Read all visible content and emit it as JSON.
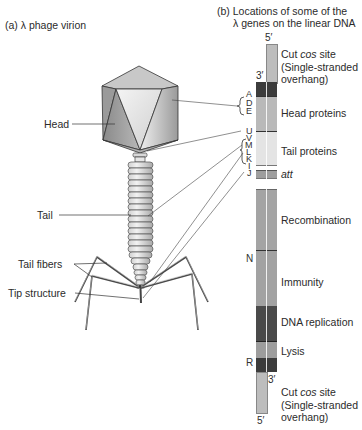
{
  "panel_a": {
    "title": "(a)  λ phage virion",
    "labels": {
      "head": "Head",
      "tail": "Tail",
      "tail_fibers": "Tail fibers",
      "tip_structure": "Tip structure"
    }
  },
  "panel_b": {
    "title_line1": "(b) Locations of some of the",
    "title_line2": "λ genes on the linear DNA",
    "strand_ends": {
      "top_5": "5′",
      "top_3": "3′",
      "bottom_3": "3′",
      "bottom_5": "5′"
    },
    "genes": [
      "A",
      "D",
      "E",
      "U",
      "V",
      "M",
      "L",
      "K",
      "I",
      "J",
      "N",
      "R"
    ],
    "regions": [
      {
        "name": "cos-top",
        "label_line1_pre": "Cut ",
        "label_italic": "cos",
        "label_line1_post": " site",
        "label_line2": "(Single-stranded",
        "label_line3": "overhang)",
        "color": "#bdbdbd"
      },
      {
        "name": "head-proteins",
        "label": "Head proteins",
        "color": "#b9b9b9"
      },
      {
        "name": "tail-proteins",
        "label": "Tail proteins",
        "color": "#e4e4e4"
      },
      {
        "name": "att",
        "label": "att",
        "color": "#9e9e9e"
      },
      {
        "name": "recombination",
        "label": "Recombination",
        "color": "#a4a4a4"
      },
      {
        "name": "immunity",
        "label": "Immunity",
        "color": "#a2a2a2"
      },
      {
        "name": "dna-replication",
        "label": "DNA replication",
        "color": "#4a4a4a"
      },
      {
        "name": "lysis",
        "label": "Lysis",
        "color": "#9d9d9d"
      },
      {
        "name": "cos-bottom",
        "label_line1_pre": "Cut ",
        "label_italic": "cos",
        "label_line1_post": " site",
        "label_line2": "(Single-stranded",
        "label_line3": "overhang)",
        "color": "#bdbdbd"
      }
    ]
  }
}
